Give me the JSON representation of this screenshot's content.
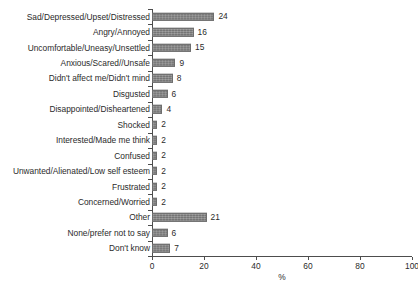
{
  "chart_data": {
    "type": "bar",
    "orientation": "horizontal",
    "title": "",
    "xlabel": "%",
    "ylabel": "",
    "xlim": [
      0,
      100
    ],
    "xticks": [
      0,
      20,
      40,
      60,
      80,
      100
    ],
    "grid": false,
    "legend": null,
    "bar_color": "#808080",
    "axis_color": "#4d4d4d",
    "background": "#ffffff",
    "categories": [
      "Sad/Depressed/Upset/Distressed",
      "Angry/Annoyed",
      "Uncomfortable/Uneasy/Unsettled",
      "Anxious/Scared//Unsafe",
      "Didn't affect me/Didn't mind",
      "Disgusted",
      "Disappointed/Disheartened",
      "Shocked",
      "Interested/Made me think",
      "Confused",
      "Unwanted/Alienated/Low self esteem",
      "Frustrated",
      "Concerned/Worried",
      "Other",
      "None/prefer not to say",
      "Don't know"
    ],
    "values": [
      24,
      16,
      15,
      9,
      8,
      6,
      4,
      2,
      2,
      2,
      2,
      2,
      2,
      21,
      6,
      7
    ],
    "value_labels": [
      "24",
      "16",
      "15",
      "9",
      "8",
      "6",
      "4",
      "2",
      "2",
      "2",
      "2",
      "2",
      "2",
      "21",
      "6",
      "7"
    ],
    "xtick_labels": [
      "0",
      "20",
      "40",
      "60",
      "80",
      "100"
    ]
  }
}
